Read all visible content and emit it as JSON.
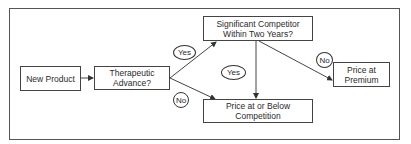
{
  "diagram": {
    "type": "flowchart",
    "nodes": {
      "new_product": "New Product",
      "therapeutic": "Therapeutic Advance?",
      "competitor": "Significant Competitor Within Two Years?",
      "below": "Price at or Below Competition",
      "premium": "Price at Premium"
    },
    "edge_labels": {
      "therapeutic_yes": "Yes",
      "therapeutic_no": "No",
      "competitor_yes": "Yes",
      "competitor_no": "No"
    },
    "edges": [
      {
        "from": "New Product",
        "to": "Therapeutic Advance?",
        "label": ""
      },
      {
        "from": "Therapeutic Advance?",
        "to": "Significant Competitor Within Two Years?",
        "label": "Yes"
      },
      {
        "from": "Therapeutic Advance?",
        "to": "Price at or Below Competition",
        "label": "No"
      },
      {
        "from": "Significant Competitor Within Two Years?",
        "to": "Price at or Below Competition",
        "label": "Yes"
      },
      {
        "from": "Significant Competitor Within Two Years?",
        "to": "Price at Premium",
        "label": "No"
      }
    ],
    "colors": {
      "line": "#444444",
      "background": "#ffffff"
    }
  }
}
